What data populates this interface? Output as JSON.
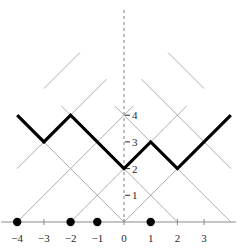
{
  "figure": {
    "type": "lattice-path-diagram",
    "width": 248,
    "height": 251,
    "background_color": "#ffffff"
  },
  "colors": {
    "lattice_line": "#9a9a9a",
    "path_line": "#000000",
    "axis_line": "#8c8c8c",
    "dashed_axis": "#8c8c8c",
    "marker_fill": "#000000",
    "label_text": "#2a2a2a"
  },
  "geometry": {
    "origin_x": 124,
    "origin_y": 222,
    "unit_x": 26.7,
    "unit_y": 26.7,
    "path_stroke_width": 3.2,
    "lattice_stroke_width": 0.8,
    "axis_stroke_width": 1.2,
    "marker_radius": 4.2
  },
  "vertical_axis": {
    "name": "dashed-vertical-axis",
    "dash_pattern": "3,3",
    "x": 0,
    "y_top": 10,
    "y_bottom": 222,
    "ticks": [
      {
        "label": "1",
        "value": 1
      },
      {
        "label": "2",
        "value": 2
      },
      {
        "label": "3",
        "value": 3
      },
      {
        "label": "4",
        "value": 4
      }
    ]
  },
  "horizontal_axis": {
    "name": "number-line",
    "x_start": -4.6,
    "x_end": 4.2,
    "ticks": [
      {
        "label": "−4",
        "value": -4
      },
      {
        "label": "−3",
        "value": -3
      },
      {
        "label": "−2",
        "value": -2
      },
      {
        "label": "−1",
        "value": -1
      },
      {
        "label": "0",
        "value": 0
      },
      {
        "label": "1",
        "value": 1
      },
      {
        "label": "2",
        "value": 2
      },
      {
        "label": "3",
        "value": 3
      }
    ],
    "markers": [
      -4,
      -2,
      -1,
      1
    ]
  },
  "chart_data": {
    "type": "line",
    "title": "",
    "xlabel": "",
    "ylabel": "",
    "xlim": [
      -4.6,
      4.2
    ],
    "ylim": [
      0,
      6
    ],
    "grid": true,
    "legend": null,
    "series": [
      {
        "name": "highlighted-lattice-path",
        "style": "thick-black",
        "x": [
          -4,
          -3,
          -2,
          0,
          1,
          2,
          4
        ],
        "values": [
          4,
          3,
          4,
          2,
          3,
          2,
          4
        ],
        "vertices": [
          {
            "x": -4,
            "y": 4
          },
          {
            "x": -3,
            "y": 3
          },
          {
            "x": -2,
            "y": 4
          },
          {
            "x": 0,
            "y": 2
          },
          {
            "x": 1,
            "y": 3
          },
          {
            "x": 2,
            "y": 2
          },
          {
            "x": 4,
            "y": 4
          }
        ]
      }
    ],
    "lattice": {
      "name": "diagonal-grid",
      "description": "45-degree lattice of up-diagonals and down-diagonals",
      "up_diagonals": [
        {
          "x0": -4,
          "y0": 0,
          "x1": 0.35,
          "y1": 4.35
        },
        {
          "x0": -4,
          "y0": 2,
          "x1": -0.65,
          "y1": 5.35
        },
        {
          "x0": -3,
          "y0": 5,
          "x1": -1.65,
          "y1": 6.35
        },
        {
          "x0": -2,
          "y0": 0,
          "x1": 2.35,
          "y1": 4.35
        },
        {
          "x0": 0,
          "y0": 0,
          "x1": 3.0,
          "y1": 3.0
        }
      ],
      "down_diagonals": [
        {
          "x0": 4,
          "y0": 0,
          "x1": -0.35,
          "y1": 4.35
        },
        {
          "x0": 4,
          "y0": 2,
          "x1": 0.65,
          "y1": 5.35
        },
        {
          "x0": 3,
          "y0": 5,
          "x1": 1.65,
          "y1": 6.35
        },
        {
          "x0": 2,
          "y0": 0,
          "x1": -2.35,
          "y1": 4.35
        },
        {
          "x0": 0,
          "y0": 0,
          "x1": -3.0,
          "y1": 3.0
        }
      ]
    },
    "y_tick_values": [
      1,
      2,
      3,
      4
    ],
    "y_tick_labels": [
      "1",
      "2",
      "3",
      "4"
    ],
    "x_tick_values": [
      -4,
      -3,
      -2,
      -1,
      0,
      1,
      2,
      3
    ],
    "x_tick_labels": [
      "−4",
      "−3",
      "−2",
      "−1",
      "0",
      "1",
      "2",
      "3"
    ],
    "marked_points": [
      -4,
      -2,
      -1,
      1
    ]
  }
}
